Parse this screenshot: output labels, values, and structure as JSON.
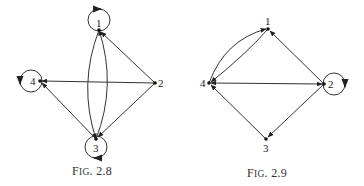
{
  "figures": [
    {
      "id": "fig-2-8",
      "caption_prefix": "F",
      "caption_smallcaps": "IG",
      "caption_number": ". 2.8",
      "nodes": [
        {
          "label": "1",
          "x": 99,
          "y": 30,
          "self_loop": true
        },
        {
          "label": "2",
          "x": 155,
          "y": 83,
          "self_loop": false
        },
        {
          "label": "3",
          "x": 96,
          "y": 139,
          "self_loop": true
        },
        {
          "label": "4",
          "x": 40,
          "y": 81,
          "self_loop": true
        }
      ],
      "edges": [
        {
          "from": "2",
          "to": "1",
          "type": "straight"
        },
        {
          "from": "2",
          "to": "4",
          "type": "straight"
        },
        {
          "from": "2",
          "to": "3",
          "type": "straight"
        },
        {
          "from": "3",
          "to": "4",
          "type": "straight"
        },
        {
          "from": "1",
          "to": "3",
          "type": "curved-left"
        },
        {
          "from": "3",
          "to": "1",
          "type": "curved-right"
        }
      ]
    },
    {
      "id": "fig-2-9",
      "caption_prefix": "F",
      "caption_smallcaps": "IG",
      "caption_number": ". 2.9",
      "nodes": [
        {
          "label": "1",
          "x": 268,
          "y": 29,
          "self_loop": false
        },
        {
          "label": "2",
          "x": 324,
          "y": 84,
          "self_loop": true
        },
        {
          "label": "3",
          "x": 266,
          "y": 139,
          "self_loop": false
        },
        {
          "label": "4",
          "x": 209,
          "y": 83,
          "self_loop": false
        }
      ],
      "edges": [
        {
          "from": "2",
          "to": "1",
          "type": "straight"
        },
        {
          "from": "4",
          "to": "2",
          "type": "straight-bidirectional"
        },
        {
          "from": "2",
          "to": "3",
          "type": "straight"
        },
        {
          "from": "3",
          "to": "4",
          "type": "straight"
        },
        {
          "from": "4",
          "to": "1",
          "type": "curved-upper"
        },
        {
          "from": "1",
          "to": "4",
          "type": "curved-lower"
        }
      ]
    }
  ]
}
